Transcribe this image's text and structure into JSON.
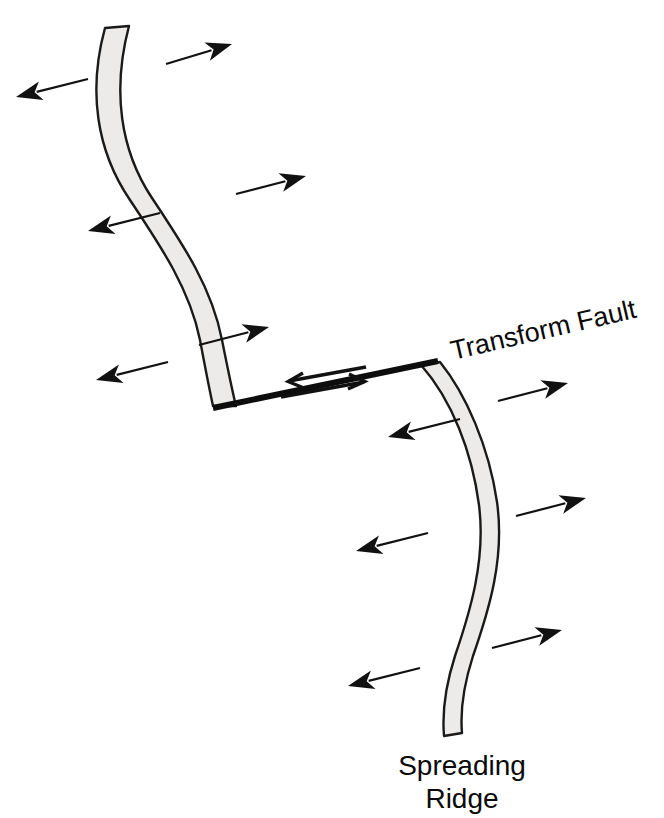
{
  "diagram": {
    "background_color": "#ffffff",
    "ink_color": "#111111",
    "ridge_fill_color": "#ecebe9",
    "ridge_outline_color": "#1a1a1a",
    "labels": {
      "transform_fault": "Transform Fault",
      "spreading_ridge_line1": "Spreading",
      "spreading_ridge_line2": "Ridge",
      "transform_fault_rotation_deg": -13,
      "transform_fault_x": 453,
      "transform_fault_y": 360,
      "spreading_ridge_x": 462,
      "spreading_ridge_line1_y": 775,
      "spreading_ridge_line2_y": 808
    },
    "ridges": [
      {
        "name": "upper-spreading-ridge",
        "path": "M 105,28 C 88,90 96,150 130,200 C 162,248 190,290 200,340 C 206,372 210,392 213,406 L 236,406 C 232,390 228,370 222,340 C 212,288 184,246 152,198 C 120,150 112,90 129,26 Z"
      },
      {
        "name": "lower-spreading-ridge",
        "path": "M 421,365 C 452,400 472,452 479,505 C 486,560 470,612 455,656 C 446,684 442,712 444,736 L 462,733 C 460,710 464,684 473,656 C 489,610 505,558 497,502 C 489,447 466,394 440,362 Z"
      }
    ],
    "fault": {
      "name": "transform-fault-line",
      "x1": 213,
      "y1": 408,
      "x2": 438,
      "y2": 361
    },
    "shear_arrows": [
      {
        "name": "shear-arrow-left",
        "direction": "left",
        "x1": 366,
        "y1": 367,
        "x2": 289,
        "y2": 381,
        "head": "M 303,373 L 288,381.5 L 304,388"
      },
      {
        "name": "shear-arrow-right",
        "direction": "right",
        "x1": 281,
        "y1": 397,
        "x2": 364,
        "y2": 382,
        "head": "M 349,374 L 365,381.5 L 348,389"
      }
    ],
    "motion_arrows": [
      {
        "name": "motion-arrow-left-1",
        "side": "left",
        "x1": 88,
        "y1": 79,
        "x2": 16,
        "y2": 97
      },
      {
        "name": "motion-arrow-left-2",
        "side": "left",
        "x1": 160,
        "y1": 213,
        "x2": 88,
        "y2": 231
      },
      {
        "name": "motion-arrow-left-3",
        "side": "left",
        "x1": 168,
        "y1": 362,
        "x2": 96,
        "y2": 380
      },
      {
        "name": "motion-arrow-left-4",
        "side": "left",
        "x1": 460,
        "y1": 419,
        "x2": 388,
        "y2": 437
      },
      {
        "name": "motion-arrow-left-5",
        "side": "left",
        "x1": 428,
        "y1": 533,
        "x2": 356,
        "y2": 551
      },
      {
        "name": "motion-arrow-left-6",
        "side": "left",
        "x1": 420,
        "y1": 668,
        "x2": 348,
        "y2": 686
      },
      {
        "name": "motion-arrow-right-1",
        "side": "right",
        "x1": 166,
        "y1": 64,
        "x2": 232,
        "y2": 44
      },
      {
        "name": "motion-arrow-right-2",
        "side": "right",
        "x1": 236,
        "y1": 194,
        "x2": 306,
        "y2": 176
      },
      {
        "name": "motion-arrow-right-3",
        "side": "right",
        "x1": 199,
        "y1": 345,
        "x2": 269,
        "y2": 327
      },
      {
        "name": "motion-arrow-right-4",
        "side": "right",
        "x1": 498,
        "y1": 401,
        "x2": 568,
        "y2": 383
      },
      {
        "name": "motion-arrow-right-5",
        "side": "right",
        "x1": 516,
        "y1": 516,
        "x2": 586,
        "y2": 498
      },
      {
        "name": "motion-arrow-right-6",
        "side": "right",
        "x1": 492,
        "y1": 648,
        "x2": 562,
        "y2": 630
      }
    ]
  }
}
